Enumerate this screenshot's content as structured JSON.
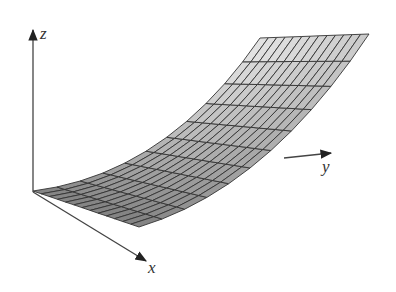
{
  "diagram": {
    "type": "3d-surface-plot",
    "axes": {
      "x": {
        "label": "x"
      },
      "y": {
        "label": "y"
      },
      "z": {
        "label": "z"
      }
    },
    "surface": {
      "grid_u": 13,
      "grid_v": 11,
      "fill_dark": "#6e6e6e",
      "fill_light": "#e8e8e8",
      "line_color": "#333333"
    },
    "colors": {
      "axis": "#444444",
      "background": "#ffffff"
    }
  }
}
